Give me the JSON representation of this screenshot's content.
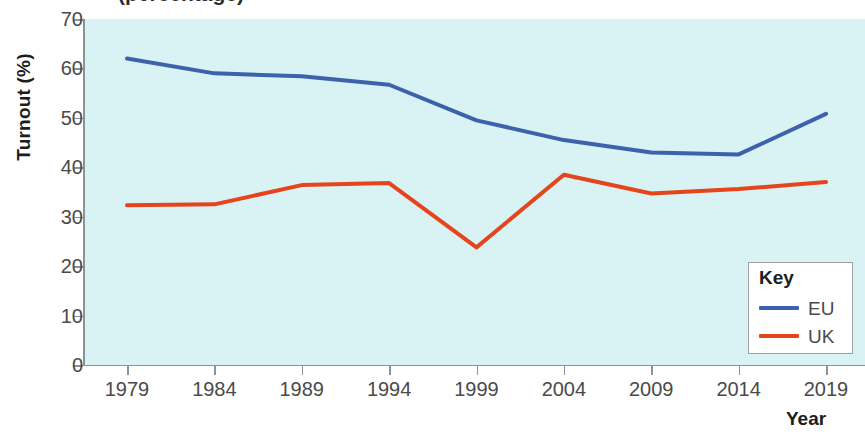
{
  "figure": {
    "cropped_title_fragment": "(percentage)",
    "plot_background": "#d9f2f4",
    "axis_color": "#8b9396"
  },
  "legend": {
    "title": "Key",
    "entries": [
      {
        "label": "EU",
        "color": "#3d62ab"
      },
      {
        "label": "UK",
        "color": "#e4451c"
      }
    ]
  },
  "chart_data": {
    "type": "line",
    "title": "",
    "xlabel": "Year",
    "ylabel": "Turnout (%)",
    "categories": [
      "1979",
      "1984",
      "1989",
      "1994",
      "1999",
      "2004",
      "2009",
      "2014",
      "2019"
    ],
    "x": [
      1979,
      1984,
      1989,
      1994,
      1999,
      2004,
      2009,
      2014,
      2019
    ],
    "xlim": [
      1979,
      2019
    ],
    "ylim": [
      0,
      70
    ],
    "yticks": [
      0,
      10,
      20,
      30,
      40,
      50,
      60,
      70
    ],
    "ytick_labels": [
      "0",
      "10",
      "20",
      "30",
      "40",
      "50",
      "60",
      "70"
    ],
    "grid": false,
    "legend_position": "bottom-right",
    "series": [
      {
        "name": "EU",
        "color": "#3d62ab",
        "values": [
          62.0,
          59.0,
          58.4,
          56.7,
          49.5,
          45.5,
          43.0,
          42.6,
          50.8
        ]
      },
      {
        "name": "UK",
        "color": "#e4451c",
        "values": [
          32.3,
          32.5,
          36.4,
          36.8,
          23.8,
          38.5,
          34.7,
          35.6,
          37.0
        ]
      }
    ]
  }
}
